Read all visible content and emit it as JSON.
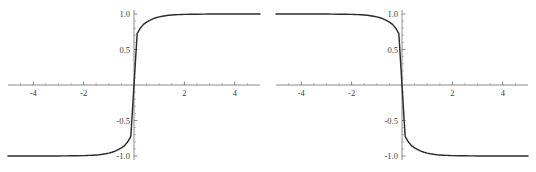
{
  "figure": {
    "background_color": "#ffffff",
    "width": 536,
    "height": 172,
    "panel_count": 2
  },
  "style": {
    "curve_color": "#2b2b2b",
    "axis_color": "#5a5a5a",
    "minor_tick_color": "#8a8a8a",
    "label_color": "#3c3c3c"
  },
  "chart_data": [
    {
      "type": "line",
      "name": "left-plot",
      "title": "",
      "subtitle": "",
      "xlabel": "",
      "ylabel": "",
      "xlim": [
        -5,
        5
      ],
      "ylim": [
        -1.05,
        1.05
      ],
      "grid": false,
      "legend": null,
      "legend_position": "none",
      "axis_style": "centered-cross",
      "x_ticks_major": [
        -4,
        -2,
        2,
        4
      ],
      "x_tick_labels": [
        "-4",
        "-2",
        "2",
        "4"
      ],
      "x_ticks_minor": [
        -4.5,
        -3.5,
        -3,
        -2.5,
        -1.5,
        -1,
        -0.5,
        0.5,
        1,
        1.5,
        2.5,
        3,
        3.5,
        4.5
      ],
      "y_ticks_major": [
        1.0,
        0.5,
        -0.5,
        -1.0
      ],
      "y_tick_labels": [
        "1.0",
        "0.5",
        "-0.5",
        "-1.0"
      ],
      "y_ticks_minor": [
        0.9,
        0.8,
        0.7,
        0.6,
        0.4,
        0.3,
        0.2,
        0.1,
        -0.1,
        -0.2,
        -0.3,
        -0.4,
        -0.6,
        -0.7,
        -0.8,
        -0.9
      ],
      "function": "tanh(1.6x)",
      "description": "increasing sigmoid, asymptotes at -1 and +1, passes through origin",
      "x": [
        -5.0,
        -4.75,
        -4.5,
        -4.25,
        -4.0,
        -3.75,
        -3.5,
        -3.25,
        -3.0,
        -2.75,
        -2.5,
        -2.25,
        -2.0,
        -1.875,
        -1.75,
        -1.625,
        -1.5,
        -1.375,
        -1.25,
        -1.125,
        -1.0,
        -0.875,
        -0.75,
        -0.625,
        -0.5,
        -0.375,
        -0.25,
        -0.125,
        0.0,
        0.125,
        0.25,
        0.375,
        0.5,
        0.625,
        0.75,
        0.875,
        1.0,
        1.125,
        1.25,
        1.375,
        1.5,
        1.625,
        1.75,
        1.875,
        2.0,
        2.25,
        2.5,
        2.75,
        3.0,
        3.25,
        3.5,
        3.75,
        4.0,
        4.25,
        4.5,
        4.75,
        5.0
      ],
      "y": [
        -1.0,
        -1.0,
        -1.0,
        -0.9999,
        -0.9999,
        -0.9998,
        -0.9997,
        -0.9995,
        -0.9991,
        -0.9986,
        -0.9978,
        -0.9966,
        -0.9946,
        -0.9932,
        -0.9913,
        -0.9888,
        -0.9855,
        -0.9813,
        -0.9757,
        -0.9686,
        -0.9591,
        -0.9469,
        -0.9311,
        -0.9108,
        -0.8854,
        -0.8535,
        -0.7999,
        -0.7226,
        -0.0,
        0.7226,
        0.7999,
        0.8535,
        0.8854,
        0.9108,
        0.9311,
        0.9469,
        0.9591,
        0.9686,
        0.9757,
        0.9813,
        0.9855,
        0.9888,
        0.9913,
        0.9932,
        0.9946,
        0.9966,
        0.9978,
        0.9986,
        0.9991,
        0.9995,
        0.9997,
        0.9998,
        0.9999,
        0.9999,
        1.0,
        1.0,
        1.0
      ]
    },
    {
      "type": "line",
      "name": "right-plot",
      "title": "",
      "subtitle": "",
      "xlabel": "",
      "ylabel": "",
      "xlim": [
        -5,
        5
      ],
      "ylim": [
        -1.05,
        1.05
      ],
      "grid": false,
      "legend": null,
      "legend_position": "none",
      "axis_style": "centered-cross",
      "x_ticks_major": [
        -4,
        -2,
        2,
        4
      ],
      "x_tick_labels": [
        "-4",
        "-2",
        "2",
        "4"
      ],
      "x_ticks_minor": [
        -4.5,
        -3.5,
        -3,
        -2.5,
        -1.5,
        -1,
        -0.5,
        0.5,
        1,
        1.5,
        2.5,
        3,
        3.5,
        4.5
      ],
      "y_ticks_major": [
        1.0,
        0.5,
        -0.5,
        -1.0
      ],
      "y_tick_labels": [
        "1.0",
        "0.5",
        "-0.5",
        "-1.0"
      ],
      "y_ticks_minor": [
        0.9,
        0.8,
        0.7,
        0.6,
        0.4,
        0.3,
        0.2,
        0.1,
        -0.1,
        -0.2,
        -0.3,
        -0.4,
        -0.6,
        -0.7,
        -0.8,
        -0.9
      ],
      "function": "-tanh(1.6x)",
      "description": "decreasing sigmoid, mirror of left plot, asymptotes at +1 and -1, passes through origin",
      "x": [
        -5.0,
        -4.75,
        -4.5,
        -4.25,
        -4.0,
        -3.75,
        -3.5,
        -3.25,
        -3.0,
        -2.75,
        -2.5,
        -2.25,
        -2.0,
        -1.875,
        -1.75,
        -1.625,
        -1.5,
        -1.375,
        -1.25,
        -1.125,
        -1.0,
        -0.875,
        -0.75,
        -0.625,
        -0.5,
        -0.375,
        -0.25,
        -0.125,
        0.0,
        0.125,
        0.25,
        0.375,
        0.5,
        0.625,
        0.75,
        0.875,
        1.0,
        1.125,
        1.25,
        1.375,
        1.5,
        1.625,
        1.75,
        1.875,
        2.0,
        2.25,
        2.5,
        2.75,
        3.0,
        3.25,
        3.5,
        3.75,
        4.0,
        4.25,
        4.5,
        4.75,
        5.0
      ],
      "y": [
        1.0,
        1.0,
        1.0,
        0.9999,
        0.9999,
        0.9998,
        0.9997,
        0.9995,
        0.9991,
        0.9986,
        0.9978,
        0.9966,
        0.9946,
        0.9932,
        0.9913,
        0.9888,
        0.9855,
        0.9813,
        0.9757,
        0.9686,
        0.9591,
        0.9469,
        0.9311,
        0.9108,
        0.8854,
        0.8535,
        0.7999,
        0.7226,
        0.0,
        -0.7226,
        -0.7999,
        -0.8535,
        -0.8854,
        -0.9108,
        -0.9311,
        -0.9469,
        -0.9591,
        -0.9686,
        -0.9757,
        -0.9813,
        -0.9855,
        -0.9888,
        -0.9913,
        -0.9932,
        -0.9946,
        -0.9966,
        -0.9978,
        -0.9986,
        -0.9991,
        -0.9995,
        -0.9997,
        -0.9998,
        -0.9999,
        -0.9999,
        -1.0,
        -1.0,
        -1.0
      ]
    }
  ]
}
